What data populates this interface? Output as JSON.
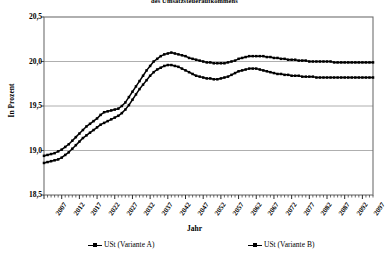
{
  "chart_data": {
    "type": "line",
    "title": "des Umsatzsteueraufkommens",
    "xlabel": "Jahr",
    "ylabel": "In Prozent",
    "ylim": [
      18.5,
      20.5
    ],
    "yticks": [
      "18,5",
      "19,0",
      "19,5",
      "20,0",
      "20,5"
    ],
    "ytick_values": [
      18.5,
      19.0,
      19.5,
      20.0,
      20.5
    ],
    "xlim": [
      2007,
      2100
    ],
    "xtick_labels": [
      "2007",
      "2012",
      "2017",
      "2022",
      "2027",
      "2032",
      "2037",
      "2042",
      "2047",
      "2052",
      "2057",
      "2062",
      "2067",
      "2072",
      "2077",
      "2082",
      "2087",
      "2092",
      "2097"
    ],
    "xtick_values": [
      2007,
      2012,
      2017,
      2022,
      2027,
      2032,
      2037,
      2042,
      2047,
      2052,
      2057,
      2062,
      2067,
      2072,
      2077,
      2082,
      2087,
      2092,
      2097
    ],
    "grid": true,
    "legend_position": "bottom",
    "x": [
      2007,
      2008,
      2009,
      2010,
      2011,
      2012,
      2013,
      2014,
      2015,
      2016,
      2017,
      2018,
      2019,
      2020,
      2021,
      2022,
      2023,
      2024,
      2025,
      2026,
      2027,
      2028,
      2029,
      2030,
      2031,
      2032,
      2033,
      2034,
      2035,
      2036,
      2037,
      2038,
      2039,
      2040,
      2041,
      2042,
      2043,
      2044,
      2045,
      2046,
      2047,
      2048,
      2049,
      2050,
      2051,
      2052,
      2053,
      2054,
      2055,
      2056,
      2057,
      2058,
      2059,
      2060,
      2061,
      2062,
      2063,
      2064,
      2065,
      2066,
      2067,
      2068,
      2069,
      2070,
      2071,
      2072,
      2073,
      2074,
      2075,
      2076,
      2077,
      2078,
      2079,
      2080,
      2081,
      2082,
      2083,
      2084,
      2085,
      2086,
      2087,
      2088,
      2089,
      2090,
      2091,
      2092,
      2093,
      2094,
      2095,
      2096,
      2097,
      2098,
      2099,
      2100
    ],
    "series": [
      {
        "name": "USt (Variante A)",
        "marker": "square",
        "color": "#000000",
        "values": [
          18.94,
          18.95,
          18.96,
          18.97,
          18.99,
          19.01,
          19.04,
          19.07,
          19.11,
          19.15,
          19.19,
          19.23,
          19.27,
          19.3,
          19.33,
          19.36,
          19.4,
          19.43,
          19.44,
          19.45,
          19.46,
          19.47,
          19.5,
          19.54,
          19.6,
          19.66,
          19.72,
          19.78,
          19.84,
          19.9,
          19.95,
          20.0,
          20.03,
          20.06,
          20.08,
          20.09,
          20.1,
          20.09,
          20.08,
          20.07,
          20.06,
          20.04,
          20.03,
          20.02,
          20.01,
          20.0,
          19.99,
          19.99,
          19.98,
          19.98,
          19.98,
          19.98,
          19.99,
          20.0,
          20.01,
          20.03,
          20.04,
          20.05,
          20.06,
          20.06,
          20.06,
          20.06,
          20.06,
          20.05,
          20.05,
          20.04,
          20.04,
          20.03,
          20.03,
          20.02,
          20.02,
          20.02,
          20.01,
          20.01,
          20.01,
          20.0,
          20.0,
          20.0,
          20.0,
          20.0,
          20.0,
          20.0,
          19.99,
          19.99,
          19.99,
          19.99,
          19.99,
          19.99,
          19.99,
          19.99,
          19.99,
          19.99,
          19.99,
          19.99
        ]
      },
      {
        "name": "USt (Variante B)",
        "marker": "square",
        "color": "#000000",
        "values": [
          18.86,
          18.87,
          18.88,
          18.89,
          18.9,
          18.92,
          18.95,
          18.98,
          19.02,
          19.06,
          19.1,
          19.14,
          19.17,
          19.2,
          19.23,
          19.26,
          19.29,
          19.31,
          19.33,
          19.35,
          19.37,
          19.39,
          19.42,
          19.46,
          19.51,
          19.57,
          19.63,
          19.69,
          19.74,
          19.79,
          19.84,
          19.88,
          19.91,
          19.93,
          19.95,
          19.96,
          19.96,
          19.95,
          19.94,
          19.92,
          19.9,
          19.88,
          19.86,
          19.84,
          19.83,
          19.82,
          19.81,
          19.81,
          19.8,
          19.8,
          19.81,
          19.82,
          19.83,
          19.85,
          19.87,
          19.89,
          19.9,
          19.91,
          19.92,
          19.92,
          19.92,
          19.91,
          19.9,
          19.89,
          19.88,
          19.87,
          19.86,
          19.86,
          19.85,
          19.85,
          19.84,
          19.84,
          19.84,
          19.83,
          19.83,
          19.83,
          19.83,
          19.82,
          19.82,
          19.82,
          19.82,
          19.82,
          19.82,
          19.82,
          19.82,
          19.82,
          19.82,
          19.82,
          19.82,
          19.82,
          19.82,
          19.82,
          19.82,
          19.82
        ]
      }
    ]
  }
}
